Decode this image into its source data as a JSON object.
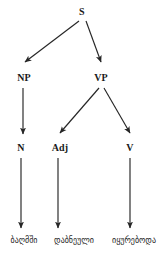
{
  "figure": {
    "type": "syntax-parse-tree",
    "width": 165,
    "height": 257,
    "background_color": "#ffffff",
    "line_color": "#262626"
  },
  "nodes": {
    "root": {
      "label": "S",
      "x": 82,
      "y": 13
    },
    "np": {
      "label": "NP",
      "x": 24,
      "y": 79
    },
    "vp": {
      "label": "VP",
      "x": 101,
      "y": 79
    },
    "n": {
      "label": "N",
      "x": 21,
      "y": 149
    },
    "adj": {
      "label": "Adj",
      "x": 60,
      "y": 149
    },
    "v": {
      "label": "V",
      "x": 130,
      "y": 149
    }
  },
  "terminals": [
    {
      "label": "ბაღმში",
      "x": 24,
      "y": 243
    },
    {
      "label": "დაბნეული",
      "x": 74,
      "y": 243
    },
    {
      "label": "იყურებოდა",
      "x": 134,
      "y": 243
    }
  ],
  "edges": [
    {
      "from": "S",
      "to": "NP",
      "kind": "diagonal-arrow"
    },
    {
      "from": "S",
      "to": "VP",
      "kind": "diagonal-arrow"
    },
    {
      "from": "NP",
      "to": "N",
      "kind": "vertical-arrow"
    },
    {
      "from": "VP",
      "to": "Adj",
      "kind": "diagonal-arrow"
    },
    {
      "from": "VP",
      "to": "V",
      "kind": "diagonal-arrow"
    },
    {
      "from": "N",
      "to": "ბაღმში",
      "kind": "vertical-arrow"
    },
    {
      "from": "Adj",
      "to": "დაბნეული",
      "kind": "vertical-arrow"
    },
    {
      "from": "V",
      "to": "იყურებოდა",
      "kind": "vertical-arrow"
    }
  ]
}
